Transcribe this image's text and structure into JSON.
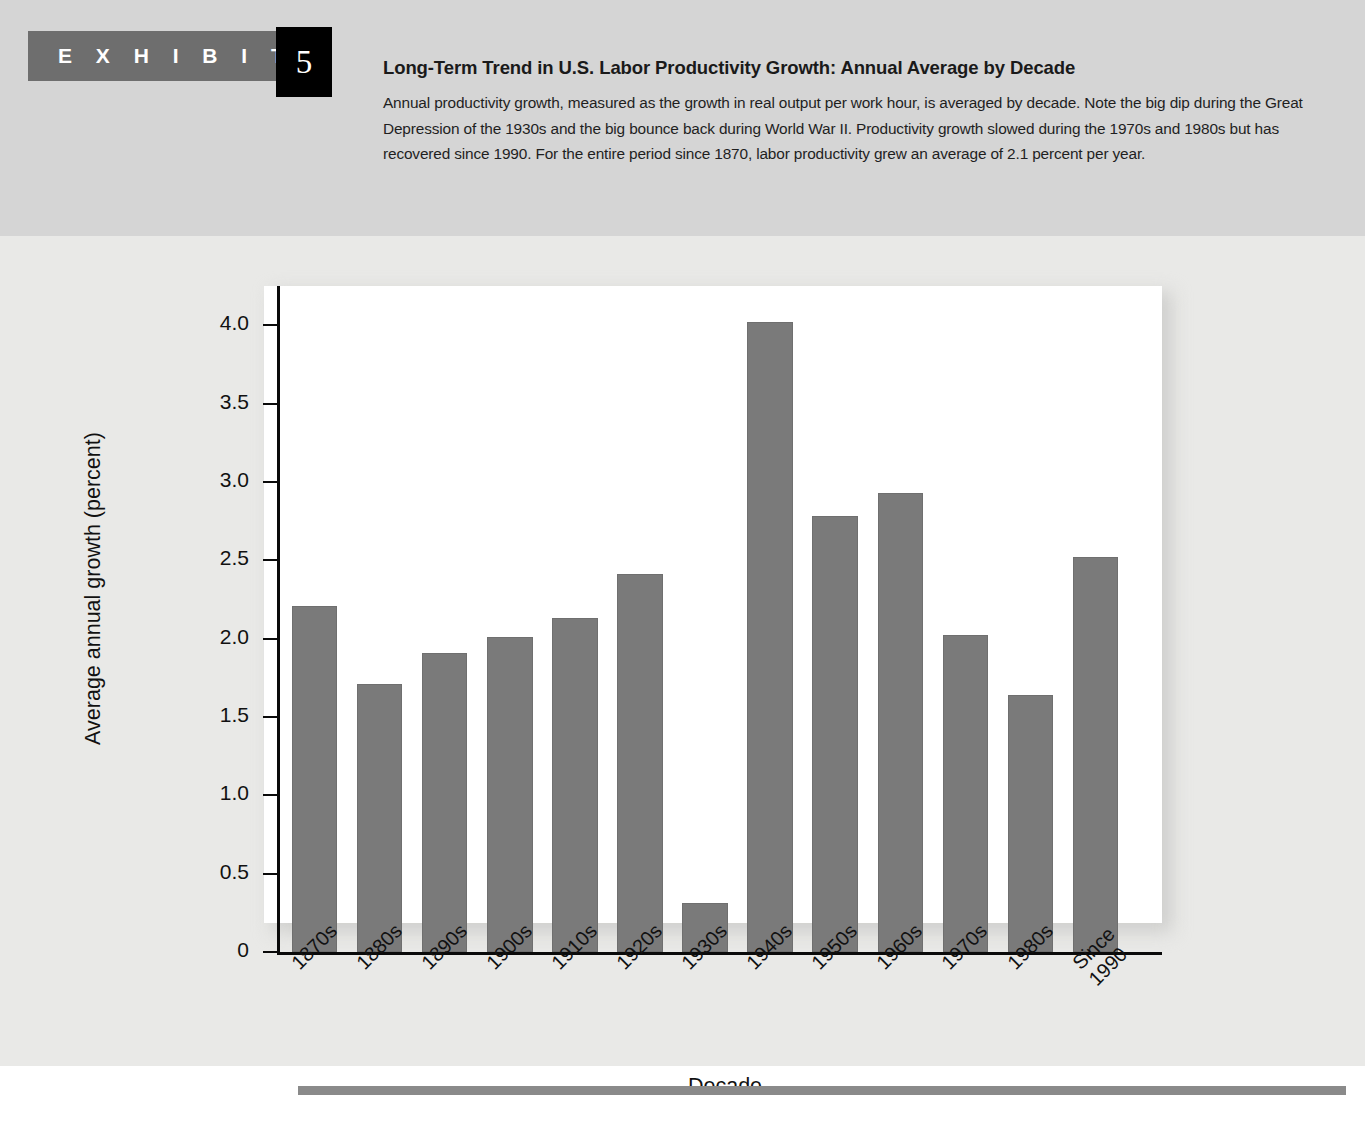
{
  "header": {
    "exhibit_word": "E X H I B I T",
    "exhibit_number": "5",
    "title": "Long-Term Trend in U.S. Labor Productivity Growth: Annual Average by Decade",
    "description": "Annual productivity growth, measured as the growth in real output per work hour, is averaged by decade. Note the big dip during the Great Depression of the 1930s and the big bounce back during World War II. Productivity growth slowed during the 1970s and 1980s but has recovered since 1990. For the entire period since 1870, labor productivity grew an average of 2.1 percent per year."
  },
  "colors": {
    "bar_fill": "#7a7a7a",
    "banner": "#d5d5d5",
    "exhibit_bar": "#6e6e6e",
    "exhibit_number_box": "#000000",
    "plot_background": "#ffffff",
    "chart_background": "#e9e9e7",
    "axis": "#0a0a0a",
    "footer_rule": "#8a8a8a"
  },
  "chart_data": {
    "type": "bar",
    "title": "Long-Term Trend in U.S. Labor Productivity Growth: Annual Average by Decade",
    "xlabel": "Decade",
    "ylabel": "Average annual growth (percent)",
    "categories": [
      "1870s",
      "1880s",
      "1890s",
      "1900s",
      "1910s",
      "1920s",
      "1930s",
      "1940s",
      "1950s",
      "1960s",
      "1970s",
      "1980s",
      "Since\n1990"
    ],
    "values": [
      2.21,
      1.71,
      1.91,
      2.01,
      2.13,
      2.41,
      0.31,
      4.02,
      2.78,
      2.93,
      2.02,
      1.64,
      2.52
    ],
    "ylim": [
      0,
      4.25
    ],
    "yticks": [
      0,
      0.5,
      1.0,
      1.5,
      2.0,
      2.5,
      3.0,
      3.5,
      4.0
    ],
    "ytick_labels": [
      "0",
      "0.5",
      "1.0",
      "1.5",
      "2.0",
      "2.5",
      "3.0",
      "3.5",
      "4.0"
    ],
    "grid": false,
    "legend": null
  }
}
